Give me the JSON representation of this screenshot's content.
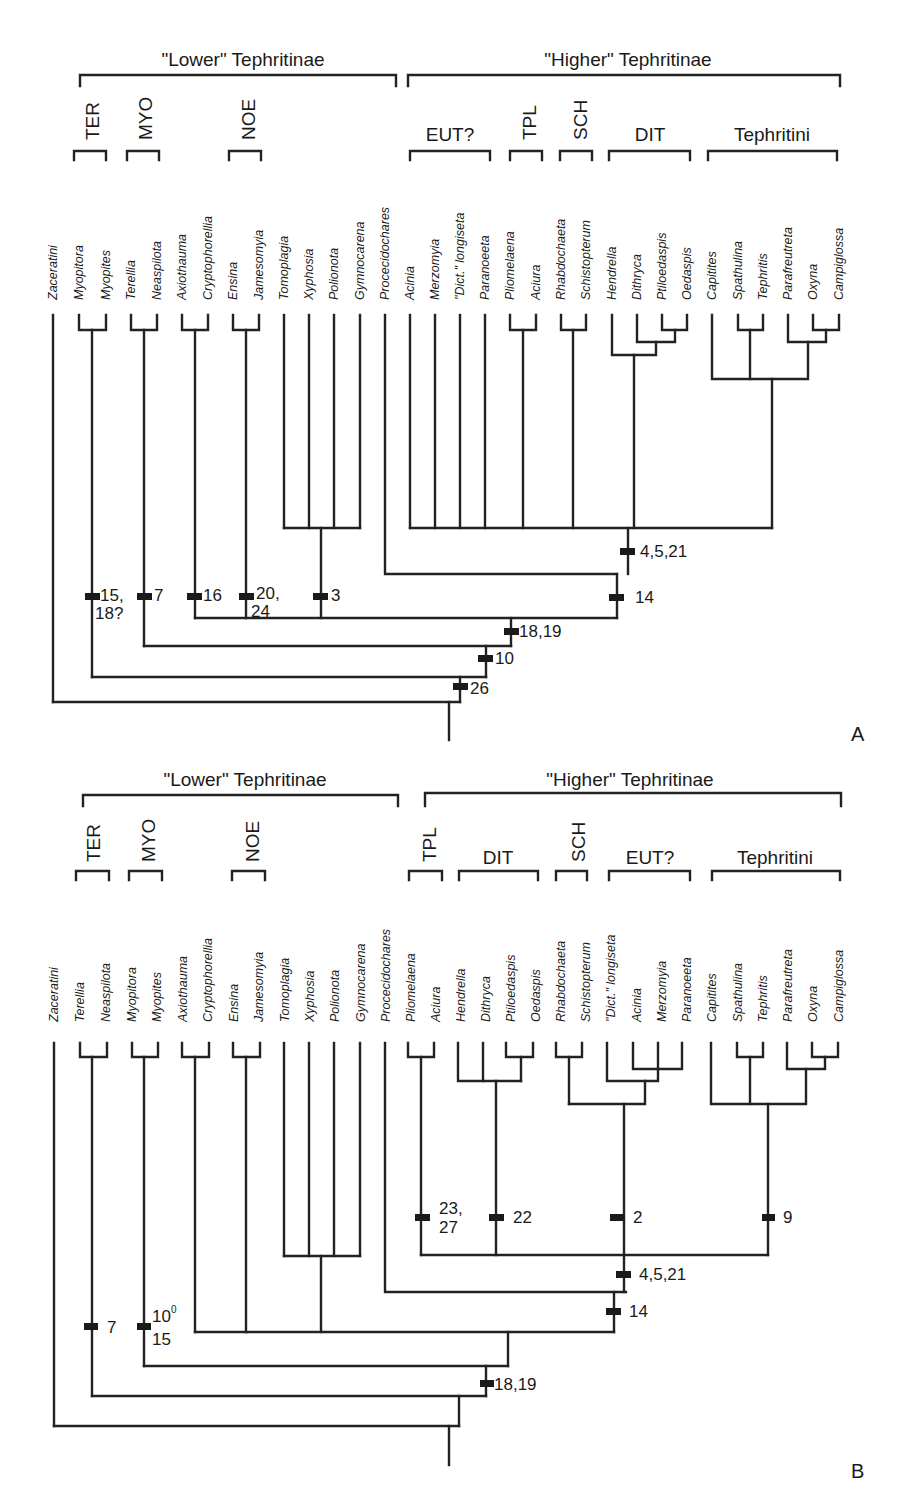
{
  "figure": {
    "panels": [
      {
        "id": "A",
        "panel_label": "A",
        "groups": {
          "lower": "\"Lower\" Tephritinae",
          "higher": "\"Higher\" Tephritinae"
        },
        "subgroups": {
          "ter": "TER",
          "myo": "MYO",
          "noe": "NOE",
          "eut": "EUT?",
          "tpl": "TPL",
          "sch": "SCH",
          "dit": "DIT",
          "tephritini": "Tephritini"
        },
        "taxa": [
          "Zaceratini",
          "Myopitora",
          "Myopites",
          "Terellia",
          "Neaspilota",
          "Axiothauma",
          "Cryptophorellia",
          "Ensina",
          "Jamesomyia",
          "Tomoplagia",
          "Xyphosia",
          "Polionota",
          "Gymnocarena",
          "Procecidochares",
          "Acinia",
          "Merzomyia",
          "\"Dict.\" longiseta",
          "Paranoeeta",
          "Pliomelaena",
          "Aciura",
          "Rhabdochaeta",
          "Schistopterum",
          "Hendrella",
          "Dithryca",
          "Ptiloedaspis",
          "Oedaspis",
          "Capitites",
          "Spathulina",
          "Tephritis",
          "Parafreutreta",
          "Oxyna",
          "Campiglossa"
        ],
        "characters": {
          "c1": "4,5,21",
          "c2": "14",
          "c3a": "15,",
          "c3b": "18?",
          "c4": "7",
          "c5": "16",
          "c6a": "20,",
          "c6b": "24",
          "c7": "3",
          "c8": "18,19",
          "c9": "10",
          "c10": "26"
        }
      },
      {
        "id": "B",
        "panel_label": "B",
        "groups": {
          "lower": "\"Lower\" Tephritinae",
          "higher": "\"Higher\" Tephritinae"
        },
        "subgroups": {
          "ter": "TER",
          "myo": "MYO",
          "noe": "NOE",
          "tpl": "TPL",
          "dit": "DIT",
          "sch": "SCH",
          "eut": "EUT?",
          "tephritini": "Tephritini"
        },
        "taxa": [
          "Zaceratini",
          "Terellia",
          "Neaspilota",
          "Myopitora",
          "Myopites",
          "Axiothauma",
          "Cryptophorellia",
          "Ensina",
          "Jamesomyia",
          "Tomoplagia",
          "Xyphosia",
          "Polionota",
          "Gymnocarena",
          "Procecidochares",
          "Pliomelaena",
          "Aciura",
          "Hendrella",
          "Dithryca",
          "Ptiloedaspis",
          "Oedaspis",
          "Rhabdochaeta",
          "Schistopterum",
          "\"Dict.\" longiseta",
          "Acinia",
          "Merzomyia",
          "Paranoeeta",
          "Capitites",
          "Spathulina",
          "Tephritis",
          "Parafreutreta",
          "Oxyna",
          "Campiglossa"
        ],
        "characters": {
          "c1a": "23,",
          "c1b": "27",
          "c2": "22",
          "c3": "2",
          "c4": "9",
          "c5": "4,5,21",
          "c6": "14",
          "c7": "7",
          "c8a": "10",
          "c8sup": "0",
          "c8b": "15",
          "c9": "18,19"
        }
      }
    ]
  }
}
